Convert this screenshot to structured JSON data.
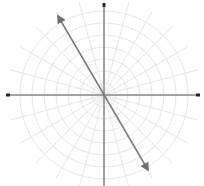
{
  "diagram": {
    "type": "polar-grid",
    "center": {
      "x": 104,
      "y": 95
    },
    "ring_count": 7,
    "ring_spacing": 12,
    "spoke_angle_step_deg": 15,
    "grid_color": "#e6e6e6",
    "axis_color": "#555555",
    "vector_color": "#7a7a7a",
    "axes": {
      "horizontal": {
        "x1": 8,
        "x2": 198,
        "arrows": "both"
      },
      "vertical": {
        "y1": 5,
        "y2": 186,
        "arrows": "start"
      }
    },
    "vector": {
      "from": {
        "x": 58,
        "y": 16
      },
      "to": {
        "x": 148,
        "y": 170
      },
      "arrows": "both"
    }
  }
}
